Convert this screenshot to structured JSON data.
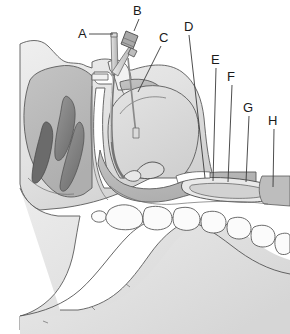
{
  "figure": {
    "width": 290,
    "height": 334,
    "background_color": "#ffffff"
  },
  "labels": [
    {
      "id": "A",
      "text": "A",
      "x": 78,
      "y": 38,
      "leader_from": [
        89,
        34
      ],
      "leader_to": [
        113,
        34
      ],
      "points_to": "tube-proximal-end"
    },
    {
      "id": "B",
      "text": "B",
      "x": 136,
      "y": 14,
      "leader_from": [
        139,
        18
      ],
      "leader_to": [
        134,
        35
      ],
      "points_to": "tube-connector"
    },
    {
      "id": "C",
      "text": "C",
      "x": 163,
      "y": 41,
      "leader_from": [
        162,
        45
      ],
      "leader_to": [
        139,
        90
      ],
      "points_to": "oral-cavity-uvula"
    },
    {
      "id": "D",
      "text": "D",
      "x": 188,
      "y": 30,
      "leader_from": [
        189,
        34
      ],
      "leader_to": [
        205,
        178
      ],
      "points_to": "epiglottis"
    },
    {
      "id": "E",
      "text": "E",
      "x": 214,
      "y": 63,
      "leader_from": [
        215,
        67
      ],
      "leader_to": [
        213,
        181
      ],
      "points_to": "laryngeal-inlet"
    },
    {
      "id": "F",
      "text": "F",
      "x": 229,
      "y": 80,
      "leader_from": [
        231,
        84
      ],
      "leader_to": [
        227,
        182
      ],
      "points_to": "vocal-fold"
    },
    {
      "id": "G",
      "text": "G",
      "x": 246,
      "y": 111,
      "leader_from": [
        248,
        115
      ],
      "leader_to": [
        245,
        182
      ],
      "points_to": "cricoid-region"
    },
    {
      "id": "H",
      "text": "H",
      "x": 271,
      "y": 124,
      "leader_from": [
        273,
        128
      ],
      "leader_to": [
        272,
        186
      ],
      "points_to": "esophagus"
    }
  ],
  "colors": {
    "skin_light": "#e6e6e6",
    "skin_mid": "#d4d4d4",
    "mucosa_mid": "#b9b9b9",
    "turbinate_dark": "#8e8e8e",
    "turbinate_darker": "#6f6f6f",
    "cavity_white": "#ffffff",
    "outline": "#555555",
    "label_text": "#1a1a1a",
    "tube_gray": "#c9c9c9",
    "connector_gray": "#a8a8a8"
  },
  "anatomy": {
    "regions": [
      {
        "name": "nasal-cavity",
        "tone": "mucosa_mid"
      },
      {
        "name": "superior-concha",
        "tone": "turbinate_dark"
      },
      {
        "name": "middle-concha",
        "tone": "turbinate_darker"
      },
      {
        "name": "inferior-concha",
        "tone": "turbinate_dark"
      },
      {
        "name": "sphenoid-sinus",
        "tone": "cavity_white"
      },
      {
        "name": "hard-palate",
        "tone": "skin_light"
      },
      {
        "name": "soft-palate",
        "tone": "mucosa_mid"
      },
      {
        "name": "tongue",
        "tone": "skin_mid"
      },
      {
        "name": "oropharynx",
        "tone": "cavity_white"
      },
      {
        "name": "epiglottis",
        "tone": "mucosa_mid"
      },
      {
        "name": "larynx",
        "tone": "mucosa_mid"
      },
      {
        "name": "esophagus",
        "tone": "mucosa_mid"
      },
      {
        "name": "mandible",
        "tone": "skin_light"
      },
      {
        "name": "neck",
        "tone": "skin_light"
      }
    ],
    "vertebrae_count": 9,
    "device": {
      "name": "nasal-tube",
      "parts": [
        "proximal-tip",
        "connector-block",
        "shaft",
        "distal-tip"
      ]
    }
  }
}
